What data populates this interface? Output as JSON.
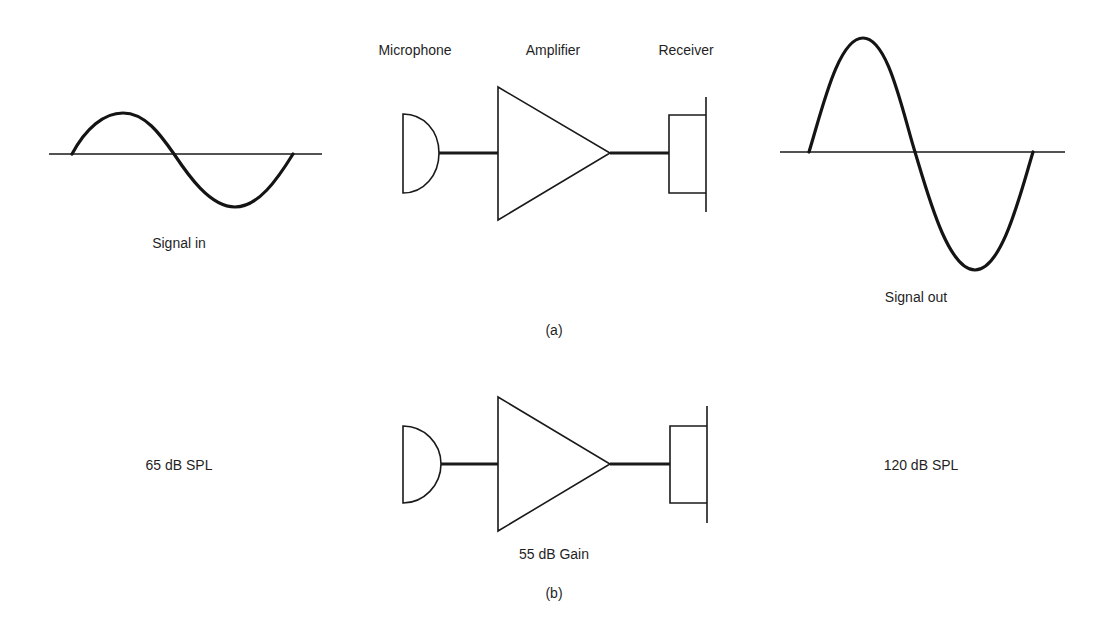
{
  "figure": {
    "panel_a": {
      "caption": "(a)",
      "component_labels": {
        "microphone": "Microphone",
        "amplifier": "Amplifier",
        "receiver": "Receiver"
      },
      "input_wave_label": "Signal in",
      "output_wave_label": "Signal out"
    },
    "panel_b": {
      "caption": "(b)",
      "input_level": "65 dB SPL",
      "output_level": "120 dB SPL",
      "amplifier_gain": "55 dB Gain"
    },
    "colors": {
      "line": "#1a1a1a",
      "background": "#ffffff",
      "text": "#1f1f1f"
    }
  }
}
